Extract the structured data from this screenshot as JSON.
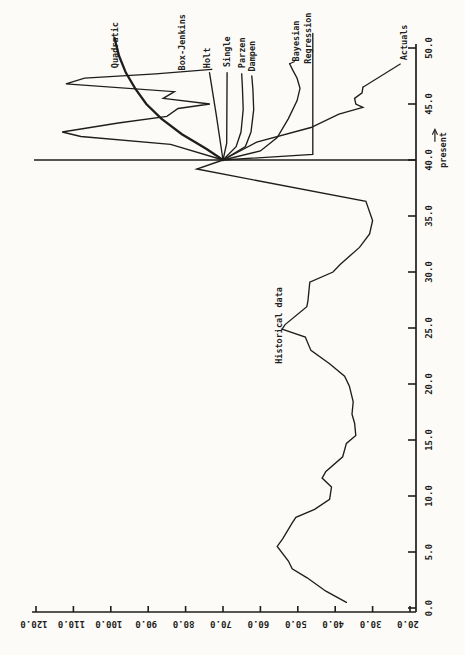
{
  "page": {
    "colors": {
      "paper": "#fcfbf7",
      "ink": "#1f1e1c"
    }
  },
  "chart_data": {
    "type": "line",
    "orientation": "rotated-90-ccw",
    "grid": false,
    "legend": "labels-annotated-on-curves",
    "time_axis": {
      "label": "",
      "range": [
        0,
        50
      ],
      "tick_step": 5,
      "tick_labels": [
        "0.0",
        "5.0",
        "10.0",
        "15.0",
        "20.0",
        "25.0",
        "30.0",
        "35.0",
        "40.0",
        "45.0",
        "50.0"
      ]
    },
    "value_axis": {
      "label": "",
      "range": [
        20,
        120
      ],
      "tick_step": 10,
      "tick_labels": [
        "120.0",
        "110.0",
        "100.0",
        "90.0",
        "80.0",
        "70.0",
        "60.0",
        "50.0",
        "40.0",
        "30.0",
        "20.0"
      ]
    },
    "present_time": 40,
    "forecast_origin": {
      "t": 40,
      "v": 70
    },
    "series": [
      {
        "name": "Historical data",
        "bold": false,
        "points": [
          [
            0.5,
            37
          ],
          [
            1.5,
            42.5
          ],
          [
            2.7,
            47.5
          ],
          [
            3.5,
            51.5
          ],
          [
            4.2,
            52.5
          ],
          [
            5.5,
            55.5
          ],
          [
            6.2,
            54
          ],
          [
            7.6,
            51.5
          ],
          [
            8.1,
            50.5
          ],
          [
            8.8,
            45.5
          ],
          [
            9.7,
            41.5
          ],
          [
            10.8,
            41
          ],
          [
            11.6,
            43.5
          ],
          [
            12.2,
            42.5
          ],
          [
            13.5,
            38
          ],
          [
            14.7,
            37
          ],
          [
            15.4,
            34.5
          ],
          [
            16.5,
            34.8
          ],
          [
            17.3,
            35.5
          ],
          [
            18.4,
            35.2
          ],
          [
            19.8,
            36.2
          ],
          [
            20.7,
            37.5
          ],
          [
            21.8,
            41.5
          ],
          [
            23,
            46.5
          ],
          [
            24.2,
            48
          ],
          [
            24.9,
            54.2
          ],
          [
            25.3,
            53.4
          ],
          [
            26.9,
            47.6
          ],
          [
            27.4,
            47.3
          ],
          [
            29.1,
            46.8
          ],
          [
            30,
            40.6
          ],
          [
            30.7,
            38.6
          ],
          [
            32.2,
            33.5
          ],
          [
            33.4,
            30.8
          ],
          [
            34.6,
            30
          ],
          [
            36.3,
            31.8
          ],
          [
            39.2,
            77
          ],
          [
            40,
            70
          ]
        ]
      },
      {
        "name": "Quadratic",
        "bold": true,
        "points": [
          [
            40,
            70
          ],
          [
            41,
            74.5
          ],
          [
            42.3,
            81
          ],
          [
            43.7,
            86.5
          ],
          [
            45,
            90.5
          ],
          [
            46.4,
            93.5
          ],
          [
            47.8,
            96
          ],
          [
            49.3,
            97.8
          ],
          [
            50.9,
            99
          ]
        ]
      },
      {
        "name": "Box-Jenkins",
        "bold": false,
        "points": [
          [
            40,
            70
          ],
          [
            41.4,
            84
          ],
          [
            42.1,
            108
          ],
          [
            42.5,
            113
          ],
          [
            43.3,
            98
          ],
          [
            43.9,
            85
          ],
          [
            44.6,
            82
          ],
          [
            45,
            73.5
          ],
          [
            45.5,
            86
          ],
          [
            46.1,
            83
          ],
          [
            46.8,
            112
          ],
          [
            47.3,
            107
          ],
          [
            47.7,
            88
          ],
          [
            48.1,
            73
          ]
        ]
      },
      {
        "name": "Holt",
        "bold": false,
        "points": [
          [
            40,
            70
          ],
          [
            44,
            71.8
          ],
          [
            47.8,
            73.6
          ]
        ]
      },
      {
        "name": "Single",
        "bold": false,
        "points": [
          [
            40,
            70
          ],
          [
            41.5,
            69
          ],
          [
            47.8,
            68.9
          ]
        ]
      },
      {
        "name": "Parzen",
        "bold": false,
        "points": [
          [
            40,
            70
          ],
          [
            41.2,
            66.5
          ],
          [
            42.5,
            65.2
          ],
          [
            44.5,
            64.6
          ],
          [
            46.5,
            64.8
          ],
          [
            47.7,
            65
          ]
        ]
      },
      {
        "name": "Dampen",
        "bold": false,
        "points": [
          [
            40,
            70
          ],
          [
            41.2,
            64
          ],
          [
            42.5,
            62.5
          ],
          [
            44.5,
            61.8
          ],
          [
            46.3,
            62
          ],
          [
            47.5,
            62.3
          ]
        ]
      },
      {
        "name": "Bayesian",
        "bold": false,
        "points": [
          [
            40,
            70
          ],
          [
            40.8,
            60
          ],
          [
            42,
            55.5
          ],
          [
            43.7,
            52.5
          ],
          [
            45.3,
            50.2
          ],
          [
            46.4,
            49.4
          ],
          [
            47.3,
            50.2
          ],
          [
            48,
            51.3
          ],
          [
            48.6,
            52.2
          ]
        ]
      },
      {
        "name": "Regression",
        "bold": false,
        "points": [
          [
            40,
            70
          ],
          [
            40.5,
            46
          ],
          [
            51.3,
            46
          ]
        ]
      },
      {
        "name": "Actuals",
        "bold": false,
        "points": [
          [
            40,
            70
          ],
          [
            41.6,
            61
          ],
          [
            42.9,
            46.5
          ],
          [
            44.1,
            39
          ],
          [
            44.7,
            32.6
          ],
          [
            45,
            34.5
          ],
          [
            45.5,
            34.8
          ],
          [
            46,
            32.8
          ],
          [
            46.5,
            32.6
          ]
        ]
      }
    ],
    "leader_lines": [
      {
        "series": "Actuals",
        "from": [
          46.5,
          32.6
        ],
        "to": [
          48.6,
          22.5
        ]
      },
      {
        "series": "Bayesian",
        "from": [
          48.6,
          52.2
        ],
        "to": [
          48.8,
          50.8
        ]
      }
    ],
    "annotations": [
      {
        "text": "Quadratic",
        "t": 48.2,
        "v": 99,
        "rotation": -90
      },
      {
        "text": "Box-Jenkins",
        "t": 48.0,
        "v": 81,
        "rotation": -90
      },
      {
        "text": "Holt",
        "t": 48.2,
        "v": 74.3,
        "rotation": -90
      },
      {
        "text": "Single",
        "t": 48.3,
        "v": 68.9,
        "rotation": -90
      },
      {
        "text": "Parzen",
        "t": 48.2,
        "v": 64.9,
        "rotation": -90
      },
      {
        "text": "Dampen",
        "t": 47.9,
        "v": 62.2,
        "rotation": -90
      },
      {
        "text": "Bayesian",
        "t": 48.8,
        "v": 50.5,
        "rotation": -90
      },
      {
        "text": "Regression",
        "t": 48.6,
        "v": 47.3,
        "rotation": -90
      },
      {
        "text": "Actuals",
        "t": 48.9,
        "v": 21.5,
        "rotation": -90
      },
      {
        "text": "Historical data",
        "t": 21.8,
        "v": 55,
        "rotation": -90
      },
      {
        "text": "present",
        "t": 39.3,
        "v": 11.2,
        "rotation": -90,
        "arrow": true
      }
    ]
  }
}
